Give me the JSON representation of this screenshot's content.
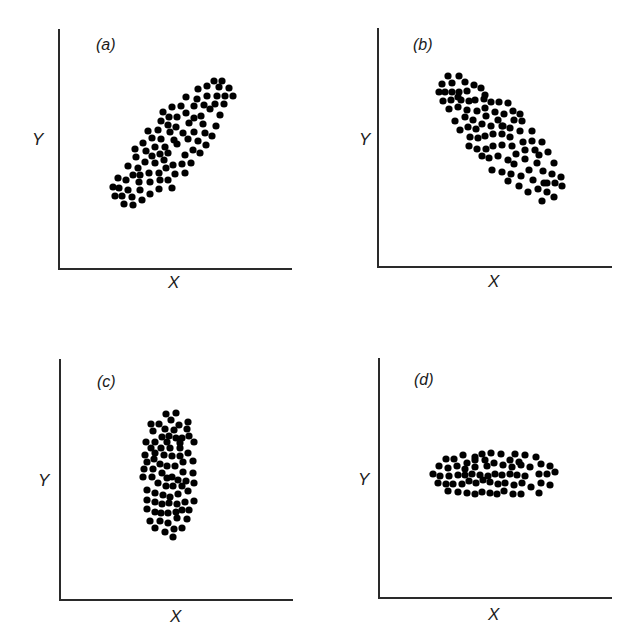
{
  "figure": {
    "panels": [
      {
        "id": "a",
        "label": "(a)",
        "xlabel": "X",
        "ylabel": "Y",
        "description": "positive correlation"
      },
      {
        "id": "b",
        "label": "(b)",
        "xlabel": "X",
        "ylabel": "Y",
        "description": "negative correlation"
      },
      {
        "id": "c",
        "label": "(c)",
        "xlabel": "X",
        "ylabel": "Y",
        "description": "vertical spread, no correlation"
      },
      {
        "id": "d",
        "label": "(d)",
        "xlabel": "X",
        "ylabel": "Y",
        "description": "horizontal spread, no correlation"
      }
    ],
    "dot_color": "#000000",
    "axis_color": "#2a2a2a"
  },
  "chart_data": [
    {
      "type": "scatter",
      "title": "(a)",
      "xlabel": "X",
      "ylabel": "Y",
      "grid": false,
      "pixel_points": [
        [
          214,
          81
        ],
        [
          222,
          81
        ],
        [
          198,
          89
        ],
        [
          207,
          86
        ],
        [
          219,
          87
        ],
        [
          229,
          88
        ],
        [
          186,
          97
        ],
        [
          197,
          99
        ],
        [
          207,
          96
        ],
        [
          217,
          96
        ],
        [
          225,
          96
        ],
        [
          233,
          96
        ],
        [
          172,
          107
        ],
        [
          181,
          106
        ],
        [
          194,
          106
        ],
        [
          204,
          105
        ],
        [
          215,
          104
        ],
        [
          224,
          104
        ],
        [
          163,
          112
        ],
        [
          169,
          117
        ],
        [
          177,
          117
        ],
        [
          186,
          113
        ],
        [
          194,
          118
        ],
        [
          201,
          116
        ],
        [
          210,
          109
        ],
        [
          220,
          115
        ],
        [
          161,
          121
        ],
        [
          168,
          125
        ],
        [
          176,
          127
        ],
        [
          189,
          123
        ],
        [
          203,
          124
        ],
        [
          216,
          126
        ],
        [
          148,
          131
        ],
        [
          158,
          130
        ],
        [
          170,
          132
        ],
        [
          183,
          133
        ],
        [
          194,
          132
        ],
        [
          205,
          133
        ],
        [
          212,
          136
        ],
        [
          143,
          143
        ],
        [
          152,
          138
        ],
        [
          161,
          139
        ],
        [
          174,
          140
        ],
        [
          188,
          139
        ],
        [
          198,
          141
        ],
        [
          206,
          145
        ],
        [
          135,
          149
        ],
        [
          146,
          151
        ],
        [
          155,
          147
        ],
        [
          165,
          147
        ],
        [
          177,
          144
        ],
        [
          193,
          150
        ],
        [
          200,
          153
        ],
        [
          136,
          157
        ],
        [
          152,
          156
        ],
        [
          160,
          154
        ],
        [
          168,
          153
        ],
        [
          185,
          155
        ],
        [
          191,
          163
        ],
        [
          128,
          166
        ],
        [
          138,
          168
        ],
        [
          145,
          162
        ],
        [
          155,
          163
        ],
        [
          164,
          160
        ],
        [
          173,
          165
        ],
        [
          182,
          164
        ],
        [
          118,
          178
        ],
        [
          126,
          180
        ],
        [
          133,
          175
        ],
        [
          140,
          175
        ],
        [
          149,
          173
        ],
        [
          159,
          173
        ],
        [
          166,
          168
        ],
        [
          175,
          174
        ],
        [
          185,
          173
        ],
        [
          113,
          187
        ],
        [
          119,
          188
        ],
        [
          128,
          190
        ],
        [
          139,
          182
        ],
        [
          150,
          182
        ],
        [
          160,
          180
        ],
        [
          168,
          180
        ],
        [
          115,
          196
        ],
        [
          122,
          196
        ],
        [
          132,
          197
        ],
        [
          140,
          190
        ],
        [
          150,
          194
        ],
        [
          159,
          189
        ],
        [
          172,
          188
        ],
        [
          124,
          204
        ],
        [
          133,
          205
        ],
        [
          142,
          200
        ]
      ]
    },
    {
      "type": "scatter",
      "title": "(b)",
      "xlabel": "X",
      "ylabel": "Y",
      "grid": false,
      "pixel_points": [
        [
          448,
          76
        ],
        [
          459,
          76
        ],
        [
          442,
          84
        ],
        [
          452,
          83
        ],
        [
          465,
          82
        ],
        [
          474,
          85
        ],
        [
          481,
          88
        ],
        [
          439,
          92
        ],
        [
          445,
          92
        ],
        [
          452,
          92
        ],
        [
          459,
          92
        ],
        [
          467,
          91
        ],
        [
          485,
          95
        ],
        [
          443,
          101
        ],
        [
          451,
          100
        ],
        [
          458,
          97
        ],
        [
          461,
          100
        ],
        [
          469,
          101
        ],
        [
          475,
          100
        ],
        [
          484,
          99
        ],
        [
          491,
          102
        ],
        [
          499,
          102
        ],
        [
          508,
          103
        ],
        [
          449,
          109
        ],
        [
          458,
          107
        ],
        [
          467,
          110
        ],
        [
          477,
          111
        ],
        [
          485,
          108
        ],
        [
          495,
          112
        ],
        [
          504,
          114
        ],
        [
          513,
          111
        ],
        [
          520,
          114
        ],
        [
          455,
          121
        ],
        [
          465,
          117
        ],
        [
          473,
          120
        ],
        [
          486,
          116
        ],
        [
          498,
          120
        ],
        [
          503,
          126
        ],
        [
          514,
          120
        ],
        [
          522,
          121
        ],
        [
          460,
          130
        ],
        [
          468,
          127
        ],
        [
          476,
          129
        ],
        [
          482,
          124
        ],
        [
          491,
          126
        ],
        [
          502,
          126
        ],
        [
          510,
          128
        ],
        [
          520,
          131
        ],
        [
          532,
          131
        ],
        [
          470,
          137
        ],
        [
          478,
          138
        ],
        [
          485,
          136
        ],
        [
          493,
          134
        ],
        [
          502,
          134
        ],
        [
          510,
          137
        ],
        [
          523,
          142
        ],
        [
          532,
          141
        ],
        [
          542,
          142
        ],
        [
          469,
          146
        ],
        [
          477,
          149
        ],
        [
          486,
          149
        ],
        [
          493,
          146
        ],
        [
          502,
          145
        ],
        [
          512,
          146
        ],
        [
          525,
          150
        ],
        [
          535,
          150
        ],
        [
          548,
          152
        ],
        [
          482,
          156
        ],
        [
          489,
          158
        ],
        [
          498,
          156
        ],
        [
          508,
          160
        ],
        [
          516,
          154
        ],
        [
          525,
          159
        ],
        [
          539,
          155
        ],
        [
          492,
          170
        ],
        [
          502,
          172
        ],
        [
          511,
          174
        ],
        [
          514,
          164
        ],
        [
          529,
          170
        ],
        [
          537,
          163
        ],
        [
          543,
          171
        ],
        [
          554,
          163
        ],
        [
          508,
          181
        ],
        [
          521,
          176
        ],
        [
          533,
          180
        ],
        [
          544,
          183
        ],
        [
          552,
          174
        ],
        [
          561,
          177
        ],
        [
          519,
          186
        ],
        [
          528,
          192
        ],
        [
          538,
          189
        ],
        [
          547,
          183
        ],
        [
          547,
          192
        ],
        [
          555,
          183
        ],
        [
          562,
          186
        ],
        [
          542,
          201
        ],
        [
          554,
          197
        ]
      ]
    },
    {
      "type": "scatter",
      "title": "(c)",
      "xlabel": "X",
      "ylabel": "Y",
      "grid": false,
      "pixel_points": [
        [
          166,
          414
        ],
        [
          176,
          413
        ],
        [
          151,
          424
        ],
        [
          159,
          424
        ],
        [
          171,
          420
        ],
        [
          179,
          425
        ],
        [
          188,
          422
        ],
        [
          153,
          431
        ],
        [
          165,
          429
        ],
        [
          174,
          430
        ],
        [
          187,
          429
        ],
        [
          162,
          437
        ],
        [
          169,
          436
        ],
        [
          176,
          438
        ],
        [
          182,
          438
        ],
        [
          189,
          436
        ],
        [
          146,
          442
        ],
        [
          155,
          442
        ],
        [
          167,
          442
        ],
        [
          180,
          443
        ],
        [
          194,
          442
        ],
        [
          151,
          448
        ],
        [
          161,
          448
        ],
        [
          170,
          448
        ],
        [
          180,
          448
        ],
        [
          145,
          455
        ],
        [
          155,
          453
        ],
        [
          164,
          455
        ],
        [
          172,
          456
        ],
        [
          180,
          456
        ],
        [
          188,
          453
        ],
        [
          147,
          462
        ],
        [
          154,
          459
        ],
        [
          160,
          464
        ],
        [
          167,
          466
        ],
        [
          175,
          466
        ],
        [
          183,
          462
        ],
        [
          193,
          461
        ],
        [
          144,
          469
        ],
        [
          153,
          469
        ],
        [
          162,
          473
        ],
        [
          172,
          477
        ],
        [
          183,
          472
        ],
        [
          193,
          473
        ],
        [
          143,
          477
        ],
        [
          152,
          477
        ],
        [
          167,
          478
        ],
        [
          178,
          480
        ],
        [
          186,
          481
        ],
        [
          194,
          483
        ],
        [
          158,
          483
        ],
        [
          166,
          486
        ],
        [
          173,
          486
        ],
        [
          182,
          486
        ],
        [
          147,
          490
        ],
        [
          155,
          493
        ],
        [
          163,
          495
        ],
        [
          170,
          497
        ],
        [
          178,
          494
        ],
        [
          188,
          491
        ],
        [
          147,
          500
        ],
        [
          155,
          502
        ],
        [
          162,
          504
        ],
        [
          169,
          503
        ],
        [
          177,
          504
        ],
        [
          185,
          502
        ],
        [
          194,
          501
        ],
        [
          147,
          509
        ],
        [
          155,
          512
        ],
        [
          161,
          513
        ],
        [
          168,
          513
        ],
        [
          176,
          512
        ],
        [
          182,
          510
        ],
        [
          189,
          510
        ],
        [
          150,
          521
        ],
        [
          160,
          521
        ],
        [
          168,
          523
        ],
        [
          177,
          518
        ],
        [
          187,
          519
        ],
        [
          155,
          528
        ],
        [
          165,
          532
        ],
        [
          174,
          529
        ],
        [
          182,
          528
        ],
        [
          173,
          537
        ]
      ]
    },
    {
      "type": "scatter",
      "title": "(d)",
      "xlabel": "X",
      "ylabel": "Y",
      "grid": false,
      "pixel_points": [
        [
          463,
          455
        ],
        [
          475,
          457
        ],
        [
          482,
          454
        ],
        [
          491,
          453
        ],
        [
          501,
          454
        ],
        [
          515,
          454
        ],
        [
          525,
          455
        ],
        [
          536,
          457
        ],
        [
          446,
          459
        ],
        [
          454,
          459
        ],
        [
          467,
          463
        ],
        [
          475,
          460
        ],
        [
          485,
          460
        ],
        [
          494,
          463
        ],
        [
          510,
          460
        ],
        [
          519,
          462
        ],
        [
          439,
          466
        ],
        [
          448,
          468
        ],
        [
          457,
          466
        ],
        [
          465,
          469
        ],
        [
          475,
          467
        ],
        [
          487,
          466
        ],
        [
          503,
          465
        ],
        [
          512,
          467
        ],
        [
          521,
          465
        ],
        [
          530,
          467
        ],
        [
          541,
          464
        ],
        [
          550,
          466
        ],
        [
          433,
          474
        ],
        [
          440,
          476
        ],
        [
          449,
          476
        ],
        [
          458,
          475
        ],
        [
          465,
          475
        ],
        [
          472,
          474
        ],
        [
          480,
          475
        ],
        [
          488,
          476
        ],
        [
          495,
          474
        ],
        [
          502,
          475
        ],
        [
          510,
          474
        ],
        [
          517,
          475
        ],
        [
          525,
          476
        ],
        [
          539,
          474
        ],
        [
          547,
          474
        ],
        [
          555,
          472
        ],
        [
          438,
          483
        ],
        [
          446,
          484
        ],
        [
          453,
          484
        ],
        [
          462,
          484
        ],
        [
          469,
          481
        ],
        [
          476,
          483
        ],
        [
          483,
          480
        ],
        [
          490,
          482
        ],
        [
          498,
          484
        ],
        [
          505,
          483
        ],
        [
          514,
          485
        ],
        [
          522,
          483
        ],
        [
          531,
          487
        ],
        [
          541,
          483
        ],
        [
          550,
          485
        ],
        [
          448,
          491
        ],
        [
          458,
          492
        ],
        [
          467,
          493
        ],
        [
          475,
          494
        ],
        [
          482,
          492
        ],
        [
          490,
          493
        ],
        [
          497,
          494
        ],
        [
          504,
          491
        ],
        [
          513,
          494
        ],
        [
          521,
          494
        ],
        [
          539,
          493
        ]
      ]
    }
  ]
}
